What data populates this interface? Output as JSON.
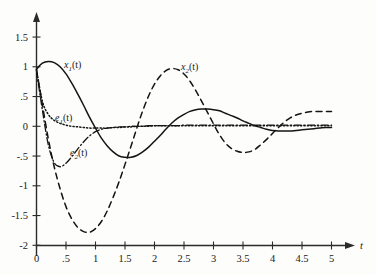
{
  "figure": {
    "background_color": "#fdfdfc",
    "ink_color": "#141414"
  },
  "axes": {
    "x_axis_name": "t",
    "x_ticks": [
      "0",
      ".5",
      "1",
      "1.5",
      "2",
      "2.5",
      "3",
      "3.5",
      "4",
      "4.5",
      "5"
    ],
    "y_ticks": [
      "1.5",
      "1",
      ".5",
      "0",
      "-.5",
      "-1",
      "-1.5",
      "-2"
    ]
  },
  "labels": {
    "x1": {
      "base": "x",
      "sub": "1",
      "arg": "(t)"
    },
    "x2": {
      "base": "x",
      "sub": "2",
      "arg": "(t)"
    },
    "e1": {
      "base": "e",
      "sub": "1",
      "arg": "(t)"
    },
    "e2": {
      "base": "e",
      "sub": "2",
      "arg": "(t)"
    }
  },
  "chart_data": {
    "type": "line",
    "title": "",
    "xlabel": "t",
    "ylabel": "",
    "xlim": [
      0,
      5
    ],
    "ylim": [
      -2,
      1.75
    ],
    "xticks": [
      0,
      0.5,
      1,
      1.5,
      2,
      2.5,
      3,
      3.5,
      4,
      4.5,
      5
    ],
    "xticklabels": [
      "0",
      ".5",
      "1",
      "1.5",
      "2",
      "2.5",
      "3",
      "3.5",
      "4",
      "4.5",
      "5"
    ],
    "yticks": [
      1.5,
      1,
      0.5,
      0,
      -0.5,
      -1,
      -1.5,
      -2
    ],
    "yticklabels": [
      "1.5",
      "1",
      ".5",
      "0",
      "-.5",
      "-1",
      "-1.5",
      "-2"
    ],
    "grid": false,
    "legend": "inline-annotations",
    "x": [
      0,
      0.1,
      0.2,
      0.3,
      0.4,
      0.5,
      0.6,
      0.7,
      0.8,
      0.9,
      1.0,
      1.1,
      1.2,
      1.3,
      1.4,
      1.5,
      1.6,
      1.7,
      1.8,
      1.9,
      2.0,
      2.1,
      2.2,
      2.3,
      2.4,
      2.5,
      2.6,
      2.7,
      2.8,
      2.9,
      3.0,
      3.1,
      3.2,
      3.3,
      3.4,
      3.5,
      3.6,
      3.7,
      3.8,
      3.9,
      4.0,
      4.1,
      4.2,
      4.3,
      4.4,
      4.5,
      4.6,
      4.7,
      4.8,
      4.9,
      5.0
    ],
    "series": [
      {
        "name": "x1(t)",
        "style": "solid",
        "values": [
          0.96,
          1.06,
          1.09,
          1.07,
          1.0,
          0.88,
          0.72,
          0.54,
          0.35,
          0.15,
          -0.03,
          -0.2,
          -0.33,
          -0.43,
          -0.5,
          -0.52,
          -0.52,
          -0.49,
          -0.43,
          -0.35,
          -0.25,
          -0.15,
          -0.04,
          0.06,
          0.14,
          0.2,
          0.25,
          0.28,
          0.29,
          0.29,
          0.28,
          0.26,
          0.22,
          0.18,
          0.14,
          0.09,
          0.05,
          0.01,
          -0.02,
          -0.05,
          -0.07,
          -0.08,
          -0.08,
          -0.08,
          -0.07,
          -0.06,
          -0.05,
          -0.04,
          -0.03,
          -0.02,
          -0.02
        ]
      },
      {
        "name": "x2(t)",
        "style": "dashed",
        "values": [
          0.95,
          0.36,
          -0.21,
          -0.68,
          -1.05,
          -1.35,
          -1.56,
          -1.7,
          -1.77,
          -1.78,
          -1.72,
          -1.6,
          -1.42,
          -1.19,
          -0.93,
          -0.64,
          -0.34,
          -0.03,
          0.26,
          0.51,
          0.71,
          0.85,
          0.94,
          0.97,
          0.95,
          0.88,
          0.76,
          0.6,
          0.42,
          0.23,
          0.04,
          -0.14,
          -0.28,
          -0.37,
          -0.42,
          -0.44,
          -0.43,
          -0.39,
          -0.31,
          -0.22,
          -0.12,
          -0.02,
          0.07,
          0.14,
          0.19,
          0.22,
          0.24,
          0.25,
          0.25,
          0.25,
          0.25
        ]
      },
      {
        "name": "e1(t)",
        "style": "dotted",
        "values": [
          0.95,
          0.42,
          0.2,
          0.1,
          0.05,
          0.02,
          0.0,
          -0.01,
          -0.02,
          -0.03,
          -0.03,
          -0.03,
          -0.03,
          -0.02,
          -0.02,
          -0.01,
          -0.01,
          0.0,
          0.0,
          0.0,
          0.01,
          0.01,
          0.01,
          0.01,
          0.01,
          0.01,
          0.01,
          0.01,
          0.01,
          0.01,
          0.01,
          0.01,
          0.01,
          0.01,
          0.01,
          0.01,
          0.01,
          0.01,
          0.01,
          0.01,
          0.01,
          0.01,
          0.01,
          0.01,
          0.01,
          0.01,
          0.01,
          0.01,
          0.01,
          0.01,
          0.01
        ]
      },
      {
        "name": "e2(t)",
        "style": "dash-dot",
        "values": [
          0.93,
          0.27,
          -0.31,
          -0.61,
          -0.68,
          -0.62,
          -0.51,
          -0.38,
          -0.26,
          -0.16,
          -0.09,
          -0.05,
          -0.03,
          -0.02,
          -0.01,
          -0.01,
          0.0,
          0.0,
          0.0,
          0.01,
          0.01,
          0.01,
          0.01,
          0.01,
          0.01,
          0.02,
          0.02,
          0.02,
          0.02,
          0.02,
          0.02,
          0.02,
          0.02,
          0.02,
          0.02,
          0.02,
          0.02,
          0.02,
          0.02,
          0.02,
          0.02,
          0.02,
          0.02,
          0.02,
          0.02,
          0.02,
          0.02,
          0.02,
          0.02,
          0.02,
          0.02
        ]
      }
    ]
  }
}
